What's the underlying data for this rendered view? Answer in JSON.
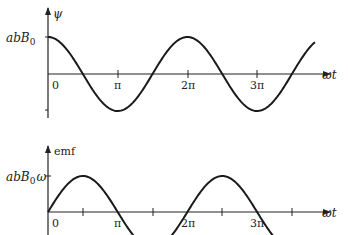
{
  "chart_data": [
    {
      "type": "line",
      "title": "",
      "ylabel": "ψ",
      "xlabel": "ωt",
      "y_tick_labels": [
        "abB0"
      ],
      "x_tick_labels": [
        "0",
        "π",
        "2π",
        "3π"
      ],
      "function": "abB0 cos(ωt)",
      "series": [
        {
          "name": "ψ",
          "x": [
            0,
            0.5,
            1,
            1.5,
            2,
            2.5,
            3,
            3.5,
            4
          ],
          "x_units": "π",
          "values": [
            1,
            0,
            -1,
            0,
            1,
            0,
            -1,
            0,
            1
          ],
          "y_units": "abB0"
        }
      ],
      "xlim_pi": [
        0,
        3.9
      ],
      "ylim": [
        -1.15,
        1.9
      ],
      "grid": false
    },
    {
      "type": "line",
      "title": "",
      "ylabel": "emf",
      "xlabel": "ωt",
      "y_tick_labels": [
        "abB0ω"
      ],
      "x_tick_labels": [
        "0",
        "π",
        "2π",
        "3π"
      ],
      "function": "abB0 ω sin(ωt)",
      "series": [
        {
          "name": "emf",
          "x": [
            0,
            0.5,
            1,
            1.5,
            2,
            2.5,
            3,
            3.5
          ],
          "x_units": "π",
          "values": [
            0,
            1,
            0,
            -1,
            0,
            1,
            0,
            -1
          ],
          "y_units": "abB0ω"
        }
      ],
      "xlim_pi": [
        0,
        3.9
      ],
      "ylim": [
        -0.7,
        2.0
      ],
      "grid": false
    }
  ],
  "top": {
    "y_axis_label": "ψ",
    "y_tick_label_main": "abB",
    "y_tick_label_sub": "0",
    "x_axis_label": "ωt",
    "x_ticks": [
      "0",
      "π",
      "2π",
      "3π"
    ]
  },
  "bottom": {
    "y_axis_label": "emf",
    "y_tick_label_main": "abB",
    "y_tick_label_sub": "0",
    "y_tick_label_suffix": "ω",
    "x_axis_label": "ωt",
    "x_ticks": [
      "0",
      "π",
      "2π",
      "3π"
    ]
  }
}
